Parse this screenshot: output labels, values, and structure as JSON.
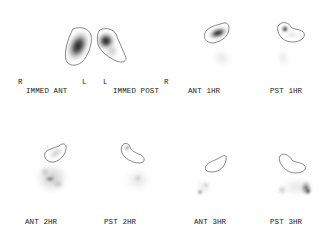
{
  "figure": {
    "type": "gastric emptying scintigraphy",
    "colors": {
      "background": "#ffffff",
      "roi_outline": "#555555",
      "activity_dark": "#1a1a1a",
      "label_text": "#222222"
    },
    "orientation_markers": [
      {
        "text": "R",
        "x": 18,
        "y": 79
      },
      {
        "text": "L",
        "x": 82,
        "y": 79
      },
      {
        "text": "L",
        "x": 103,
        "y": 79
      },
      {
        "text": "R",
        "x": 164,
        "y": 79
      }
    ],
    "panels": [
      {
        "id": "immed-ant",
        "label": "IMMED ANT",
        "label_x": 26,
        "label_y": 88
      },
      {
        "id": "immed-post",
        "label": "IMMED POST",
        "label_x": 113,
        "label_y": 88
      },
      {
        "id": "ant-1hr",
        "label": "ANT 1HR",
        "label_x": 188,
        "label_y": 88
      },
      {
        "id": "pst-1hr",
        "label": "PST 1HR",
        "label_x": 270,
        "label_y": 88
      },
      {
        "id": "ant-2hr",
        "label": "ANT 2HR",
        "label_x": 25,
        "label_y": 219
      },
      {
        "id": "pst-2hr",
        "label": "PST 2HR",
        "label_x": 104,
        "label_y": 219
      },
      {
        "id": "ant-3hr",
        "label": "ANT 3HR",
        "label_x": 194,
        "label_y": 219
      },
      {
        "id": "pst-3hr",
        "label": "PST 3HR",
        "label_x": 270,
        "label_y": 219
      }
    ]
  }
}
